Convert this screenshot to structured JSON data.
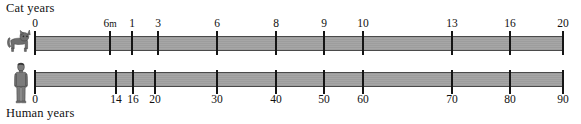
{
  "chart_data": {
    "type": "table",
    "axes": [
      {
        "name": "cat",
        "label": "Cat years",
        "icon": "cat-icon",
        "label_position": "above",
        "range": [
          0,
          20
        ],
        "ticks": [
          {
            "value": 0,
            "label": "0",
            "x": 35
          },
          {
            "value": 0.5,
            "label": "6m",
            "x": 110
          },
          {
            "value": 1,
            "label": "1",
            "x": 132
          },
          {
            "value": 3,
            "label": "3",
            "x": 158
          },
          {
            "value": 6,
            "label": "6",
            "x": 217
          },
          {
            "value": 8,
            "label": "8",
            "x": 276
          },
          {
            "value": 9,
            "label": "9",
            "x": 324
          },
          {
            "value": 10,
            "label": "10",
            "x": 363
          },
          {
            "value": 13,
            "label": "13",
            "x": 452
          },
          {
            "value": 16,
            "label": "16",
            "x": 510
          },
          {
            "value": 20,
            "label": "20",
            "x": 563
          }
        ]
      },
      {
        "name": "human",
        "label": "Human years",
        "icon": "human-icon",
        "label_position": "below",
        "range": [
          0,
          90
        ],
        "ticks": [
          {
            "value": 0,
            "label": "0",
            "x": 35
          },
          {
            "value": 14,
            "label": "14",
            "x": 116
          },
          {
            "value": 16,
            "label": "16",
            "x": 133
          },
          {
            "value": 20,
            "label": "20",
            "x": 155
          },
          {
            "value": 30,
            "label": "30",
            "x": 217
          },
          {
            "value": 40,
            "label": "40",
            "x": 276
          },
          {
            "value": 50,
            "label": "50",
            "x": 324
          },
          {
            "value": 60,
            "label": "60",
            "x": 363
          },
          {
            "value": 70,
            "label": "70",
            "x": 452
          },
          {
            "value": 80,
            "label": "80",
            "x": 510
          },
          {
            "value": 90,
            "label": "90",
            "x": 563
          }
        ]
      }
    ],
    "equivalences": [
      {
        "cat": "6m",
        "human": "14"
      },
      {
        "cat": "1",
        "human": "16"
      },
      {
        "cat": "3",
        "human": "20"
      },
      {
        "cat": "6",
        "human": "30"
      },
      {
        "cat": "8",
        "human": "40"
      },
      {
        "cat": "9",
        "human": "50"
      },
      {
        "cat": "10",
        "human": "60"
      },
      {
        "cat": "13",
        "human": "70"
      },
      {
        "cat": "16",
        "human": "80"
      },
      {
        "cat": "20",
        "human": "90"
      }
    ],
    "bar": {
      "x_start": 35,
      "x_end": 563,
      "color": "#a0a0a0",
      "edge_color": "#4a4a4a"
    },
    "grid": false,
    "legend": false
  }
}
